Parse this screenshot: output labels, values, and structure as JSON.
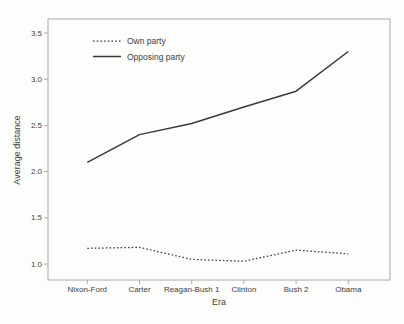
{
  "figure": {
    "background": "#fdfdfc",
    "text_color": "#3d3d3d",
    "axis_color": "#aaaaaa",
    "line_color": "#3a3a3a"
  },
  "chart_data": {
    "type": "line",
    "title": "",
    "xlabel": "Era",
    "ylabel": "Average distance",
    "categories": [
      "Nixon-Ford",
      "Carter",
      "Reagan-Bush 1",
      "Clinton",
      "Bush 2",
      "Obama"
    ],
    "series": [
      {
        "name": "Own party",
        "style": "dotted",
        "values": [
          1.17,
          1.18,
          1.05,
          1.03,
          1.15,
          1.11
        ]
      },
      {
        "name": "Opposing party",
        "style": "solid",
        "values": [
          2.1,
          2.4,
          2.52,
          2.7,
          2.87,
          3.3
        ]
      }
    ],
    "ylim": [
      0.85,
      3.65
    ],
    "yticks": [
      1.0,
      1.5,
      2.0,
      2.5,
      3.0,
      3.5
    ],
    "ytick_labels": [
      "1.0",
      "1.5",
      "2.0",
      "2.5",
      "3.0",
      "3.5"
    ],
    "grid": false,
    "legend_position": "top-left-inside"
  }
}
